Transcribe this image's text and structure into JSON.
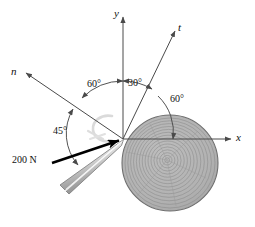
{
  "figure": {
    "type": "statics-free-body-diagram",
    "background_color": "#ffffff",
    "line_color": "#4a4a4a",
    "force_color": "#000000",
    "log_fill": "#b4b4b4",
    "log_ring_color": "#8e8e8e",
    "wedge_fill": "#c8c8c8",
    "watermark_color": "#d2d2d2"
  },
  "origin": {
    "x": 123,
    "y": 139
  },
  "axes": [
    {
      "id": "y-axis",
      "label": "y",
      "label_x": 114,
      "label_y": 8,
      "tip_x": 123,
      "tip_y": 14,
      "interactable": false
    },
    {
      "id": "x-axis",
      "label": "x",
      "label_x": 236,
      "label_y": 132,
      "tip_x": 232,
      "tip_y": 139,
      "interactable": false
    },
    {
      "id": "t-axis",
      "label": "t",
      "label_x": 178,
      "label_y": 22,
      "tip_x": 176,
      "tip_y": 28,
      "interactable": false
    },
    {
      "id": "n-axis",
      "label": "n",
      "label_x": 11,
      "label_y": 66,
      "tip_x": 24,
      "tip_y": 74,
      "interactable": false
    }
  ],
  "angles": [
    {
      "id": "angle-n-to-y",
      "value": "60°",
      "label_x": 87,
      "label_y": 79,
      "from_deg": 135,
      "to_deg": 90
    },
    {
      "id": "angle-y-to-t",
      "value": "30°",
      "label_x": 128,
      "label_y": 78,
      "from_deg": 90,
      "to_deg": 60
    },
    {
      "id": "angle-t-to-x",
      "value": "60°",
      "label_x": 170,
      "label_y": 94,
      "from_deg": 60,
      "to_deg": 0
    },
    {
      "id": "angle-force-to-n",
      "value": "45°",
      "label_x": 53,
      "label_y": 126,
      "from_deg": 180,
      "to_deg": 135
    }
  ],
  "force": {
    "id": "applied-force",
    "label": "200 N",
    "label_x": 12,
    "label_y": 155,
    "magnitude": "200",
    "unit": "N",
    "direction_deg": -160,
    "tail_x": 52,
    "tail_y": 163,
    "head_x": 123,
    "head_y": 139
  },
  "log": {
    "id": "log-cross-section",
    "center_x": 170,
    "center_y": 163,
    "radius": 48,
    "ring_count": 14
  },
  "wedge": {
    "id": "splitting-wedge",
    "tip_x": 123,
    "tip_y": 140,
    "tail_x": 63,
    "tail_y": 189
  },
  "watermark": {
    "id": "c-watermark",
    "text": "C",
    "x": 96,
    "y": 120
  }
}
